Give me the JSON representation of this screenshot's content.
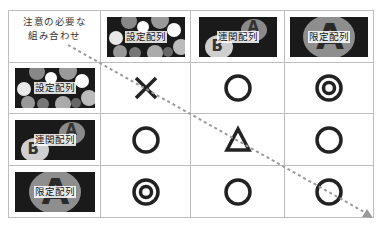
{
  "corner": {
    "line1": "注意の必要な",
    "line2": "組み合わせ"
  },
  "columns": [
    {
      "label": "設定配列",
      "image": "scattered-circles"
    },
    {
      "label": "連関配列",
      "image": "linked-A-B"
    },
    {
      "label": "限定配列",
      "image": "large-A-ellipse"
    }
  ],
  "rows": [
    {
      "label": "設定配列",
      "image": "scattered-circles",
      "cells": [
        "cross",
        "circle",
        "double-circle"
      ]
    },
    {
      "label": "連関配列",
      "image": "linked-A-B",
      "cells": [
        "circle",
        "triangle",
        "circle"
      ]
    },
    {
      "label": "限定配列",
      "image": "large-A-ellipse",
      "cells": [
        "double-circle",
        "circle",
        "circle"
      ]
    }
  ],
  "symbol_legend": {
    "cross": "×",
    "circle": "○",
    "double-circle": "◎",
    "triangle": "△"
  },
  "glyphs": {
    "a": "A",
    "b": "B"
  },
  "colors": {
    "grid": "#bdbdbd",
    "symbol": "#222222",
    "arrow": "#9a9a9a",
    "thumb_bg": "#1a1a1a"
  }
}
